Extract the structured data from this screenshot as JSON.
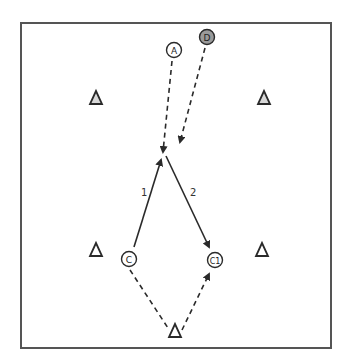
{
  "diagram": {
    "players": [
      {
        "id": "A",
        "label": "A",
        "x": 174,
        "y": 50,
        "fill": "#ffffff"
      },
      {
        "id": "D",
        "label": "D",
        "x": 207,
        "y": 37,
        "fill": "#9a9a9a"
      },
      {
        "id": "C",
        "label": "C",
        "x": 129,
        "y": 259,
        "fill": "#ffffff"
      },
      {
        "id": "C1",
        "label": "C1",
        "x": 215,
        "y": 260,
        "fill": "#ffffff"
      }
    ],
    "cones": [
      {
        "x": 96,
        "y": 98
      },
      {
        "x": 264,
        "y": 98
      },
      {
        "x": 96,
        "y": 250
      },
      {
        "x": 262,
        "y": 250
      },
      {
        "x": 175,
        "y": 330
      }
    ],
    "pass_labels": [
      {
        "text": "1",
        "x": 141,
        "y": 196
      },
      {
        "text": "2",
        "x": 193,
        "y": 196
      }
    ],
    "colors": {
      "stroke": "#2a2a2a",
      "border": "#555555",
      "cone_fill": "#d8d8d8"
    }
  }
}
